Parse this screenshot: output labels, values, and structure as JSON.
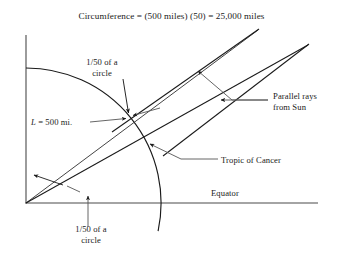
{
  "figure": {
    "title": "Circumference = (500 miles) (50) = 25,000 miles",
    "background_color": "#ffffff",
    "line_color": "#1a1a1a",
    "leader_color": "#555555"
  },
  "labels": {
    "upper_fraction_line1": "1/50 of a",
    "upper_fraction_line2": "circle",
    "length_symbol": "L",
    "length_value": " = 500 mi.",
    "parallel_rays_line1": "Parallel rays",
    "parallel_rays_line2": "from Sun",
    "tropic_of_cancer": "Tropic of Cancer",
    "equator": "Equator",
    "lower_fraction_line1": "1/50 of a",
    "lower_fraction_line2": "circle"
  },
  "diagram_data": {
    "type": "geometric-diagram",
    "subject": "Eratosthenes measurement of Earth's circumference",
    "origin": [
      26,
      203
    ],
    "vertical_axis": {
      "x": 26,
      "y_top": 35,
      "y_bottom": 203
    },
    "horizontal_axis": {
      "y": 203,
      "x_left": 26,
      "x_right": 318
    },
    "earth_arc": {
      "center": [
        26,
        203
      ],
      "radius": 135,
      "start_angle_deg": 90,
      "end_angle_deg": -12
    },
    "radius_upper": {
      "from": [
        26,
        203
      ],
      "to": [
        258,
        30
      ]
    },
    "radius_lower": {
      "from": [
        26,
        203
      ],
      "to": [
        308,
        45
      ]
    },
    "sun_rays": [
      {
        "from": [
          118,
          128
        ],
        "to": [
          258,
          30
        ]
      },
      {
        "from": [
          168,
          152
        ],
        "to": [
          308,
          45
        ]
      }
    ],
    "arc_ray_intersection_upper": [
      129,
      117
    ],
    "arc_ray_intersection_lower": [
      146,
      143
    ],
    "arc_equator_intersection": [
      168,
      203
    ]
  }
}
